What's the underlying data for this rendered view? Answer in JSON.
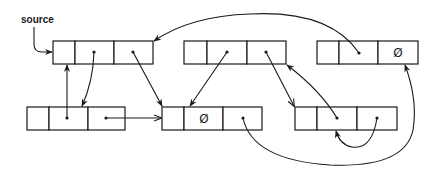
{
  "diagram": {
    "title": "",
    "source_label": "source",
    "nil_symbol": "Ø",
    "nodes": [
      {
        "id": "A",
        "x": 53,
        "y": 41,
        "cells": [
          22,
          39,
          39
        ],
        "contents": [
          "",
          "ptr",
          "ptr"
        ]
      },
      {
        "id": "B",
        "x": 184,
        "y": 41,
        "cells": [
          23,
          40,
          39
        ],
        "contents": [
          "",
          "ptr",
          "ptr"
        ]
      },
      {
        "id": "C",
        "x": 317,
        "y": 41,
        "cells": [
          22,
          39,
          40
        ],
        "contents": [
          "",
          "ptr",
          "nil"
        ]
      },
      {
        "id": "D",
        "x": 27,
        "y": 107,
        "cells": [
          22,
          39,
          37
        ],
        "contents": [
          "",
          "ptr",
          "ptr"
        ]
      },
      {
        "id": "E",
        "x": 162,
        "y": 107,
        "cells": [
          22,
          39,
          39
        ],
        "contents": [
          "",
          "nil",
          "ptr"
        ]
      },
      {
        "id": "F",
        "x": 295,
        "y": 107,
        "cells": [
          22,
          40,
          40
        ],
        "contents": [
          "",
          "ptr",
          "ptr"
        ]
      }
    ],
    "edges": [
      {
        "from": "source",
        "to": "A.cell0"
      },
      {
        "from": "A.cell1",
        "to": "D.cell1"
      },
      {
        "from": "D.cell1",
        "to": "A.cell0"
      },
      {
        "from": "A.cell2",
        "to": "E.cell0"
      },
      {
        "from": "D.cell2",
        "to": "E.cell0"
      },
      {
        "from": "B.cell1",
        "to": "E.cell1"
      },
      {
        "from": "B.cell2",
        "to": "F.cell0"
      },
      {
        "from": "C.cell1",
        "to": "A.cell2"
      },
      {
        "from": "F.cell1",
        "to": "B.cell2"
      },
      {
        "from": "F.cell2",
        "to": "F.cell1"
      },
      {
        "from": "E.cell2",
        "to": "C.cell2"
      }
    ]
  }
}
